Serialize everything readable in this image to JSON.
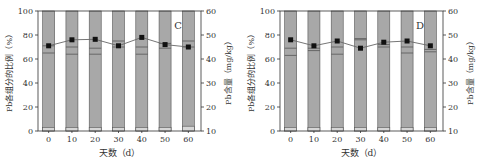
{
  "chart_data": [
    {
      "type": "bar",
      "panel_label": "C",
      "title": "",
      "xlabel": "天数（d）",
      "ylabel": "Pb各组分的比例（%）",
      "y2label": "Pb含量（mg/kg）",
      "categories": [
        "0",
        "10",
        "20",
        "30",
        "40",
        "50",
        "60"
      ],
      "ylim": [
        0,
        100
      ],
      "y2lim": [
        10,
        60
      ],
      "yticks": [
        "0",
        "20",
        "40",
        "60",
        "80",
        "100"
      ],
      "y2ticks": [
        "10",
        "20",
        "30",
        "40",
        "50",
        "60"
      ],
      "stacked_segment_boundaries_pct": [
        [
          3,
          65,
          71,
          100
        ],
        [
          3,
          64,
          70,
          100
        ],
        [
          3,
          64,
          69,
          100
        ],
        [
          3,
          70,
          75,
          100
        ],
        [
          3,
          64,
          70,
          100
        ],
        [
          3,
          69,
          73,
          100
        ],
        [
          4,
          70,
          75,
          100
        ]
      ],
      "line_series": {
        "name": "Pb含量",
        "axis": "right",
        "values": [
          45.5,
          48,
          48.2,
          45.5,
          49,
          46,
          45
        ]
      },
      "grid": false
    },
    {
      "type": "bar",
      "panel_label": "D",
      "title": "",
      "xlabel": "天数（d）",
      "ylabel": "Pb各组分的比例（%）",
      "y2label": "Pb含量（mg/kg）",
      "categories": [
        "0",
        "10",
        "20",
        "30",
        "40",
        "50",
        "60"
      ],
      "ylim": [
        0,
        100
      ],
      "y2lim": [
        10,
        60
      ],
      "yticks": [
        "0",
        "20",
        "40",
        "60",
        "80",
        "100"
      ],
      "y2ticks": [
        "10",
        "20",
        "30",
        "40",
        "50",
        "60"
      ],
      "stacked_segment_boundaries_pct": [
        [
          3,
          63,
          69,
          100
        ],
        [
          3,
          67,
          69,
          100
        ],
        [
          3,
          64,
          70,
          100
        ],
        [
          3,
          76,
          77,
          100
        ],
        [
          3,
          70,
          72,
          100
        ],
        [
          3,
          65,
          70,
          100
        ],
        [
          3,
          66,
          68,
          100
        ]
      ],
      "line_series": {
        "name": "Pb含量",
        "axis": "right",
        "values": [
          48,
          45.5,
          47.5,
          44.5,
          47,
          47.5,
          45.5
        ]
      },
      "grid": false
    }
  ],
  "colors": {
    "bar_fill": "#a8a8a8",
    "bar_bottom_fill": "#d6d6d6",
    "segment_line": "#555555",
    "marker": "#111111",
    "line": "#666666",
    "axis": "#333333"
  }
}
